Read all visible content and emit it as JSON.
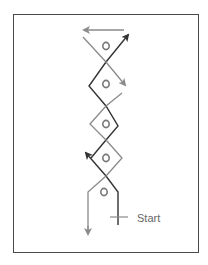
{
  "diagram": {
    "type": "drill-path",
    "start_label": "Start",
    "markers": [
      {
        "label": "O",
        "x": 106,
        "y": 46
      },
      {
        "label": "O",
        "x": 106,
        "y": 84
      },
      {
        "label": "O",
        "x": 106,
        "y": 124
      },
      {
        "label": "O",
        "x": 106,
        "y": 158
      },
      {
        "label": "O",
        "x": 104,
        "y": 192
      }
    ],
    "colors": {
      "frame": "#4a4a4a",
      "dark_path": "#333333",
      "light_path": "#8a8a8a",
      "marker": "#777777",
      "text": "#666666"
    }
  }
}
